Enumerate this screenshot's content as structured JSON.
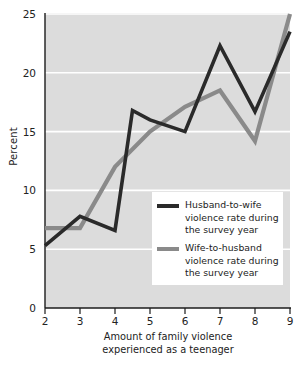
{
  "chart_data": {
    "type": "line",
    "title": "",
    "xlabel": "Amount of family violence experienced as a teenager",
    "ylabel": "Percent",
    "xlim": [
      2,
      9
    ],
    "ylim": [
      0,
      25
    ],
    "xticks": [
      2,
      3,
      4,
      5,
      6,
      7,
      8,
      9
    ],
    "yticks": [
      0,
      5,
      10,
      15,
      20,
      25
    ],
    "grid": "horizontal",
    "legend_position": "inside-lower-right",
    "plot_background": "#dcdcdc",
    "gridline_color": "#ffffff",
    "series": [
      {
        "name": "Husband-to-wife violence rate during the survey year",
        "color": "#2a2a2a",
        "x": [
          2,
          3,
          4,
          4.5,
          5,
          6,
          7,
          8,
          9
        ],
        "values": [
          5.3,
          7.8,
          6.6,
          16.8,
          16.0,
          15.0,
          22.3,
          16.7,
          23.5
        ]
      },
      {
        "name": "Wife-to-husband violence rate during the survey year",
        "color": "#8a8a8a",
        "x": [
          2,
          3,
          4,
          5,
          6,
          7,
          8,
          9
        ],
        "values": [
          6.8,
          6.8,
          12.0,
          15.0,
          17.1,
          18.5,
          14.2,
          25.0
        ]
      }
    ]
  },
  "axes": {
    "y_title": "Percent",
    "x_title_line1": "Amount of family violence",
    "x_title_line2": "experienced as a teenager",
    "y_tick_labels": [
      "0",
      "5",
      "10",
      "15",
      "20",
      "25"
    ],
    "x_tick_labels": [
      "2",
      "3",
      "4",
      "5",
      "6",
      "7",
      "8",
      "9"
    ]
  },
  "legend": {
    "items": [
      {
        "swatch": "dark",
        "line1": "Husband-to-wife",
        "line2": "violence rate during",
        "line3": "the survey year"
      },
      {
        "swatch": "gray",
        "line1": "Wife-to-husband",
        "line2": "violence rate during",
        "line3": "the survey year"
      }
    ]
  }
}
